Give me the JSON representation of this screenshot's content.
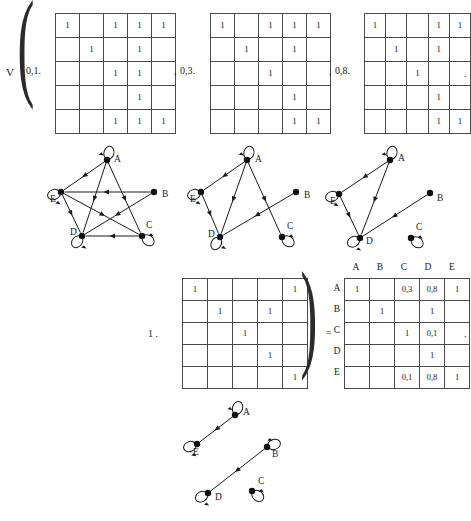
{
  "page": {
    "top_prefix": "V",
    "equals_sign": "=",
    "multiply_prefix": "1 .",
    "trailing_dot": ".",
    "separator": ","
  },
  "top_row": {
    "items": [
      {
        "coefficient": "0,1.",
        "separator": ",",
        "matrix": [
          [
            "1",
            "",
            "1",
            "1",
            "1"
          ],
          [
            "",
            "1",
            "",
            "1",
            ""
          ],
          [
            "",
            "",
            "1",
            "1",
            ""
          ],
          [
            "",
            "",
            "",
            "1",
            ""
          ],
          [
            "",
            "",
            "1",
            "1",
            "1"
          ]
        ]
      },
      {
        "coefficient": "0,3.",
        "separator": ",",
        "matrix": [
          [
            "1",
            "",
            "1",
            "1",
            "1"
          ],
          [
            "",
            "1",
            "",
            "1",
            ""
          ],
          [
            "",
            "",
            "1",
            "",
            ""
          ],
          [
            "",
            "",
            "",
            "1",
            ""
          ],
          [
            "",
            "",
            "",
            "1",
            "1"
          ]
        ]
      },
      {
        "coefficient": "0,8.",
        "separator": "",
        "matrix": [
          [
            "1",
            "",
            "",
            "1",
            "1"
          ],
          [
            "",
            "1",
            "",
            "1",
            ""
          ],
          [
            "",
            "",
            "1",
            "",
            ""
          ],
          [
            "",
            "",
            "",
            "1",
            ""
          ],
          [
            "",
            "",
            "",
            "1",
            "1"
          ]
        ]
      }
    ]
  },
  "graphs_row": {
    "graphs": [
      {
        "name": "graph-alpha-0-1",
        "nodes": [
          {
            "id": "A",
            "label": "A",
            "x": 65,
            "y": 12,
            "label_dx": 7,
            "label_dy": 2,
            "loop_angle": -75
          },
          {
            "id": "B",
            "label": "B",
            "x": 112,
            "y": 44,
            "label_dx": 8,
            "label_dy": 5,
            "loop_angle": 20
          },
          {
            "id": "C",
            "label": "C",
            "x": 100,
            "y": 88,
            "label_dx": 4,
            "label_dy": -8,
            "loop_angle": 35
          },
          {
            "id": "D",
            "label": "D",
            "x": 40,
            "y": 88,
            "label_dx": -12,
            "label_dy": -1,
            "loop_angle": 130
          },
          {
            "id": "E",
            "label": "E",
            "x": 19,
            "y": 44,
            "label_dx": -11,
            "label_dy": 10,
            "loop_angle": 160
          }
        ],
        "loops": [
          "A",
          "C",
          "D",
          "E"
        ],
        "edges": [
          {
            "from": "A",
            "to": "E"
          },
          {
            "from": "A",
            "to": "D"
          },
          {
            "from": "A",
            "to": "C"
          },
          {
            "from": "B",
            "to": "E"
          },
          {
            "from": "B",
            "to": "D"
          },
          {
            "from": "E",
            "to": "D"
          },
          {
            "from": "E",
            "to": "C"
          },
          {
            "from": "C",
            "to": "D"
          }
        ]
      },
      {
        "name": "graph-alpha-0-3",
        "nodes": [
          {
            "id": "A",
            "label": "A",
            "x": 65,
            "y": 12,
            "label_dx": 8,
            "label_dy": 2,
            "loop_angle": -75
          },
          {
            "id": "B",
            "label": "B",
            "x": 114,
            "y": 44,
            "label_dx": 8,
            "label_dy": 6,
            "loop_angle": 20
          },
          {
            "id": "C",
            "label": "C",
            "x": 100,
            "y": 89,
            "label_dx": 5,
            "label_dy": -8,
            "loop_angle": 35
          },
          {
            "id": "D",
            "label": "D",
            "x": 38,
            "y": 89,
            "label_dx": -12,
            "label_dy": 0,
            "loop_angle": 120
          },
          {
            "id": "E",
            "label": "E",
            "x": 19,
            "y": 44,
            "label_dx": -11,
            "label_dy": 10,
            "loop_angle": 160
          }
        ],
        "loops": [
          "A",
          "C",
          "D",
          "E"
        ],
        "edges": [
          {
            "from": "A",
            "to": "E"
          },
          {
            "from": "A",
            "to": "D"
          },
          {
            "from": "A",
            "to": "C"
          },
          {
            "from": "B",
            "to": "D"
          },
          {
            "from": "E",
            "to": "D"
          }
        ]
      },
      {
        "name": "graph-alpha-0-8",
        "nodes": [
          {
            "id": "A",
            "label": "A",
            "x": 78,
            "y": 12,
            "label_dx": 8,
            "label_dy": 1,
            "loop_angle": -75
          },
          {
            "id": "B",
            "label": "B",
            "x": 118,
            "y": 45,
            "label_dx": 7,
            "label_dy": 8,
            "loop_angle": 20
          },
          {
            "id": "C",
            "label": "C",
            "x": 99,
            "y": 90,
            "label_dx": 5,
            "label_dy": -8,
            "loop_angle": 35
          },
          {
            "id": "D",
            "label": "D",
            "x": 48,
            "y": 90,
            "label_dx": 6,
            "label_dy": 6,
            "loop_angle": 150
          },
          {
            "id": "E",
            "label": "E",
            "x": 27,
            "y": 46,
            "label_dx": -9,
            "label_dy": 10,
            "loop_angle": 160
          }
        ],
        "loops": [
          "A",
          "C",
          "D",
          "E"
        ],
        "edges": [
          {
            "from": "A",
            "to": "E"
          },
          {
            "from": "A",
            "to": "D"
          },
          {
            "from": "B",
            "to": "D"
          },
          {
            "from": "E",
            "to": "D"
          }
        ]
      }
    ]
  },
  "equation_row": {
    "prefix": "1 .",
    "matrix": [
      [
        "1",
        "",
        "",
        "",
        "1"
      ],
      [
        "",
        "1",
        "",
        "1",
        ""
      ],
      [
        "",
        "",
        "1",
        "",
        ""
      ],
      [
        "",
        "",
        "",
        "1",
        ""
      ],
      [
        "",
        "",
        "",
        "",
        "1"
      ]
    ],
    "equals": "=",
    "result": {
      "column_headers": [
        "A",
        "B",
        "C",
        "D",
        "E"
      ],
      "row_headers": [
        "A",
        "B",
        "C",
        "D",
        "E"
      ],
      "cells": [
        [
          "1",
          "",
          "0,3",
          "0,8",
          "1"
        ],
        [
          "",
          "1",
          "",
          "1",
          ""
        ],
        [
          "",
          "",
          "1",
          "0,1",
          ""
        ],
        [
          "",
          "",
          "",
          "1",
          ""
        ],
        [
          "",
          "",
          "0,1",
          "0,8",
          "1"
        ]
      ]
    },
    "trailing_dot": "."
  },
  "bottom_graph": {
    "name": "graph-result",
    "nodes": [
      {
        "id": "A",
        "label": "A",
        "x": 95,
        "y": 17,
        "label_dx": 8,
        "label_dy": 0,
        "loop_angle": -70
      },
      {
        "id": "B",
        "label": "B",
        "x": 127,
        "y": 49,
        "label_dx": 5,
        "label_dy": 10,
        "loop_angle": -20
      },
      {
        "id": "C",
        "label": "C",
        "x": 112,
        "y": 93,
        "label_dx": 6,
        "label_dy": -7,
        "loop_angle": 40
      },
      {
        "id": "D",
        "label": "D",
        "x": 68,
        "y": 95,
        "label_dx": 7,
        "label_dy": 7,
        "loop_angle": 150
      },
      {
        "id": "E",
        "label": "E",
        "x": 57,
        "y": 46,
        "label_dx": -4,
        "label_dy": 11,
        "loop_angle": 160
      }
    ],
    "loops": [
      "A",
      "B",
      "C",
      "D",
      "E"
    ],
    "edges": [
      {
        "from": "A",
        "to": "E"
      },
      {
        "from": "B",
        "to": "D"
      }
    ]
  }
}
